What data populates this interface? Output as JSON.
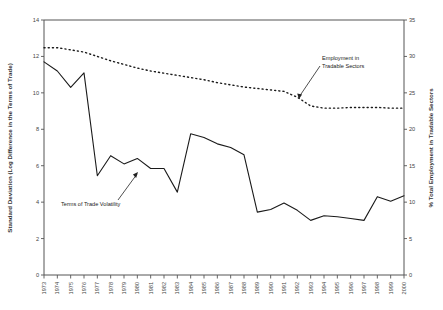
{
  "chart_data": {
    "type": "line",
    "title": "",
    "xlabel": "",
    "categories": [
      "1973",
      "1974",
      "1975",
      "1976",
      "1977",
      "1978",
      "1979",
      "1980",
      "1981",
      "1982",
      "1983",
      "1984",
      "1985",
      "1986",
      "1987",
      "1988",
      "1989",
      "1990",
      "1991",
      "1992",
      "1993",
      "1994",
      "1995",
      "1996",
      "1997",
      "1998",
      "1999",
      "2000"
    ],
    "grid": false,
    "legend_position": "none",
    "axes": {
      "left": {
        "label": "Standard Deviation (Log Difference in the Terms of Trade)",
        "ylim": [
          0,
          14
        ],
        "ticks": [
          0,
          2,
          4,
          6,
          8,
          10,
          12,
          14
        ]
      },
      "right": {
        "label": "% Total Employment in Tradable Sectors",
        "ylim": [
          0,
          35
        ],
        "ticks": [
          0,
          5,
          10,
          15,
          20,
          25,
          30,
          35
        ]
      }
    },
    "series": [
      {
        "name": "Terms of Trade Volatility",
        "axis": "left",
        "style": "solid",
        "color": "#1a1a1a",
        "values": [
          11.7,
          11.2,
          10.3,
          11.1,
          5.45,
          6.55,
          6.1,
          6.4,
          5.85,
          5.85,
          4.55,
          7.75,
          7.55,
          7.2,
          7.0,
          6.6,
          3.45,
          3.6,
          3.95,
          3.55,
          3.0,
          3.25,
          3.2,
          3.1,
          3.0,
          4.3,
          4.05,
          4.35
        ]
      },
      {
        "name": "Employment in Tradable Sectors",
        "axis": "right",
        "style": "dotted",
        "color": "#1a1a1a",
        "values": [
          31.2,
          31.2,
          30.9,
          30.6,
          30.0,
          29.4,
          28.9,
          28.4,
          28.0,
          27.7,
          27.4,
          27.1,
          26.8,
          26.4,
          26.1,
          25.8,
          25.6,
          25.4,
          25.2,
          24.4,
          23.2,
          22.9,
          22.9,
          23.0,
          23.0,
          23.0,
          22.9,
          22.9
        ]
      }
    ],
    "annotations": [
      {
        "name": "employment-annotation",
        "text_line1": "Employment in",
        "text_line2": "Tradable Sectors"
      },
      {
        "name": "volatility-annotation",
        "text_line1": "Terms of Trade Volatility"
      }
    ]
  }
}
